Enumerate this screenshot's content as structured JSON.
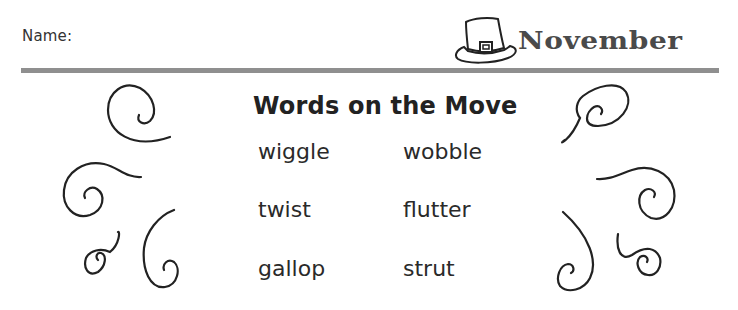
{
  "header": {
    "name_label": "Name:",
    "month": "November",
    "icon": "pilgrim-hat-icon"
  },
  "worksheet": {
    "title": "Words on the Move",
    "words": [
      [
        "wiggle",
        "wobble"
      ],
      [
        "twist",
        "flutter"
      ],
      [
        "gallop",
        "strut"
      ]
    ],
    "decoration": "swirl-icons"
  },
  "colors": {
    "divider": "#8f8f8f",
    "text": "#222222"
  }
}
